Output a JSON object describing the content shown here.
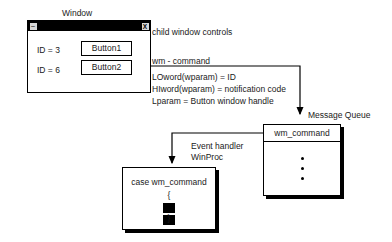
{
  "diagram": {
    "window": {
      "caption": "Window",
      "titlebar": {
        "minimize_glyph": "–",
        "close_glyph": "X"
      },
      "rows": [
        {
          "id_label": "ID = 3",
          "button_label": "Button1"
        },
        {
          "id_label": "ID = 6",
          "button_label": "Button2"
        }
      ]
    },
    "annotations": {
      "child_controls": "child window controls",
      "message_name": "wm - command",
      "event_handler_line1": "Event handler",
      "event_handler_line2": "WinProc",
      "message_queue_label": "Message Queue"
    },
    "params": [
      "LOword(wparam) = ID",
      "HIword(wparam) = notification code",
      "Lparam = Button window handle"
    ],
    "message_queue": {
      "head_item": "wm_command",
      "pending_dots": 3
    },
    "case_block": {
      "title": "case wm_command",
      "open_brace": "{",
      "close_brace": "}"
    },
    "colors": {
      "ink": "#000000",
      "text": "#1a1a1a",
      "paper": "#ffffff",
      "titlebar": "#000000"
    }
  }
}
